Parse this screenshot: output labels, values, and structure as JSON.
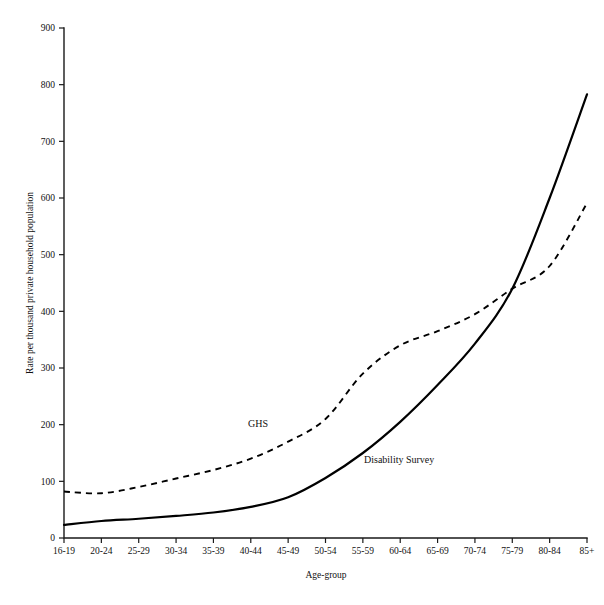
{
  "chart_data": {
    "type": "line",
    "title": "",
    "xlabel": "Age-group",
    "ylabel": "Rate per thousand private household population",
    "categories": [
      "16-19",
      "20-24",
      "25-29",
      "30-34",
      "35-39",
      "40-44",
      "45-49",
      "50-54",
      "55-59",
      "60-64",
      "65-69",
      "70-74",
      "75-79",
      "80-84",
      "85+"
    ],
    "ylim": [
      0,
      900
    ],
    "yticks": [
      0,
      100,
      200,
      300,
      400,
      500,
      600,
      700,
      800,
      900
    ],
    "grid": false,
    "legend": "inline-annotations",
    "series": [
      {
        "name": "GHS",
        "style": "dashed",
        "values": [
          82,
          79,
          90,
          105,
          120,
          140,
          170,
          210,
          290,
          340,
          365,
          395,
          440,
          480,
          591
        ]
      },
      {
        "name": "Disability Survey",
        "style": "solid",
        "values": [
          23,
          30,
          34,
          39,
          45,
          55,
          72,
          106,
          150,
          205,
          270,
          343,
          440,
          600,
          783
        ]
      }
    ],
    "annotations": [
      {
        "text": "GHS",
        "category": "45-49",
        "value": 215
      },
      {
        "text": "Disability Survey",
        "category": "57",
        "value": 135
      }
    ]
  },
  "axis": {
    "y_tick_labels": [
      "0",
      "100",
      "200",
      "300",
      "400",
      "500",
      "600",
      "700",
      "800",
      "900"
    ],
    "x_tick_labels": [
      "16-19",
      "20-24",
      "25-29",
      "30-34",
      "35-39",
      "40-44",
      "45-49",
      "50-54",
      "55-59",
      "60-64",
      "65-69",
      "70-74",
      "75-79",
      "80-84",
      "85+"
    ],
    "x_title": "Age-group",
    "y_title": "Rate per thousand private household population"
  },
  "labels": {
    "ghs": "GHS",
    "disability_survey": "Disability Survey"
  },
  "colors": {
    "line": "#000000",
    "axis": "#1a1a1a",
    "background": "#ffffff",
    "text": "#111111"
  }
}
